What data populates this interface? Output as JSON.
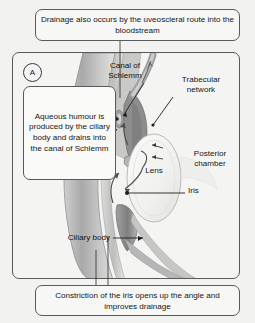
{
  "figure": {
    "panel_marker": "A",
    "top_caption": "Drainage also occurs by the uveoscleral route into the bloodstream",
    "bottom_caption": "Constriction of the iris opens up the angle and improves drainage",
    "callout": "Aqueous humour is produced by the ciliary body and drains into the canal of Schlemm",
    "labels": {
      "canal_of_schlemm": "Canal of\nSchlemm",
      "trabecular_network": "Trabecular\nnetwork",
      "posterior_chamber": "Posterior\nchamber",
      "iris": "Iris",
      "lens": "Lens",
      "ciliary_body": "Ciliary body"
    },
    "colors": {
      "page_background": "#f2f2f0",
      "panel_background": "#f4f4f2",
      "box_background": "#fafaf8",
      "border": "#5a5a5a",
      "text": "#151515",
      "tissue_dark": "#8e8e8e",
      "tissue_mid": "#b4b4b4",
      "tissue_light": "#d4d4d4",
      "tissue_pale": "#e6e6e4",
      "leader_line": "#2a2a2a"
    }
  }
}
